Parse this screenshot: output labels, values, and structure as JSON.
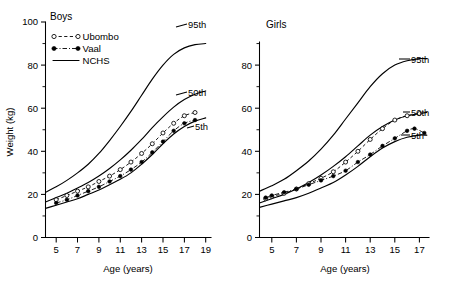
{
  "figure": {
    "axis_title_y": "Weight (kg)",
    "axis_title_x": "Age (years)"
  },
  "panels": [
    {
      "id": "boys",
      "title": "Boys",
      "y_label": "Weight (kg)",
      "x_label": "Age (years)",
      "y_ticks": [
        "0",
        "20",
        "40",
        "60",
        "80",
        "100"
      ],
      "x_ticks": [
        "5",
        "7",
        "9",
        "11",
        "13",
        "15",
        "17",
        "19"
      ],
      "curve_labels": [
        "95th",
        "50th",
        "5th"
      ]
    },
    {
      "id": "girls",
      "title": "Girls",
      "y_label": "",
      "x_label": "Age (years)",
      "y_ticks": [
        "0",
        "20",
        "40",
        "60",
        "80"
      ],
      "x_ticks": [
        "5",
        "7",
        "9",
        "11",
        "13",
        "15",
        "17"
      ],
      "curve_labels": [
        "95th",
        "50th",
        "5th"
      ]
    }
  ],
  "legend": {
    "items": [
      {
        "label": "Ubombo",
        "style": "dashed-open-circle"
      },
      {
        "label": "Vaal",
        "style": "dashdot-filled-circle"
      },
      {
        "label": "NCHS",
        "style": "solid-line"
      }
    ]
  },
  "chart_data": {
    "type": "line",
    "xlabel": "Age (years)",
    "ylabel": "Weight (kg)",
    "grid": false,
    "legend_position": "top-left",
    "panels": [
      {
        "panel": "Boys",
        "xlim": [
          4,
          19.5
        ],
        "ylim": [
          0,
          100
        ],
        "x_ticks": [
          5,
          7,
          9,
          11,
          13,
          15,
          17,
          19
        ],
        "y_ticks": [
          0,
          20,
          40,
          60,
          80,
          100
        ],
        "y_minor_ticks": [
          10,
          30,
          50,
          70,
          90
        ],
        "series": [
          {
            "name": "NCHS 95th",
            "style": "solid",
            "x": [
              4,
              5,
              6,
              7,
              8,
              9,
              10,
              11,
              12,
              13,
              14,
              15,
              16,
              17,
              18,
              19
            ],
            "y": [
              21.0,
              23.5,
              26.5,
              30.0,
              34.0,
              39.0,
              45.0,
              51.5,
              58.5,
              66.0,
              73.5,
              80.0,
              85.0,
              88.0,
              89.5,
              90.0
            ]
          },
          {
            "name": "NCHS 50th",
            "style": "solid",
            "x": [
              4,
              5,
              6,
              7,
              8,
              9,
              10,
              11,
              12,
              13,
              14,
              15,
              16,
              17,
              18,
              19
            ],
            "y": [
              16.5,
              18.5,
              20.5,
              23.0,
              25.5,
              28.5,
              32.0,
              36.0,
              40.5,
              45.5,
              51.0,
              56.0,
              60.5,
              64.0,
              66.5,
              68.0
            ]
          },
          {
            "name": "NCHS 5th",
            "style": "solid",
            "x": [
              4,
              5,
              6,
              7,
              8,
              9,
              10,
              11,
              12,
              13,
              14,
              15,
              16,
              17,
              18,
              19
            ],
            "y": [
              13.5,
              15.0,
              16.5,
              18.0,
              20.0,
              22.0,
              24.5,
              27.0,
              30.0,
              34.0,
              38.5,
              43.5,
              48.0,
              51.5,
              54.0,
              55.5
            ]
          },
          {
            "name": "Ubombo",
            "style": "dashed",
            "marker": "open-circle",
            "x": [
              5,
              6,
              7,
              8,
              9,
              10,
              11,
              12,
              13,
              14,
              15,
              16,
              17,
              18
            ],
            "y": [
              17.5,
              19.5,
              21.5,
              23.5,
              26.0,
              28.5,
              31.5,
              35.0,
              39.0,
              43.5,
              48.5,
              53.0,
              56.5,
              58.0
            ]
          },
          {
            "name": "Vaal",
            "style": "dash-dot",
            "marker": "filled-circle",
            "x": [
              5,
              6,
              7,
              8,
              9,
              10,
              11,
              12,
              13,
              14,
              15,
              16,
              17,
              18
            ],
            "y": [
              16.0,
              17.5,
              19.5,
              21.5,
              23.5,
              26.0,
              28.5,
              31.5,
              35.0,
              39.5,
              44.5,
              49.5,
              53.0,
              54.5
            ]
          }
        ],
        "annotations": [
          {
            "text": "95th",
            "x": 18.6,
            "y": 90
          },
          {
            "text": "50th",
            "x": 18.6,
            "y": 68
          },
          {
            "text": "5th",
            "x": 18.8,
            "y": 55
          }
        ]
      },
      {
        "panel": "Girls",
        "xlim": [
          4,
          17.8
        ],
        "ylim": [
          0,
          90
        ],
        "x_ticks": [
          5,
          7,
          9,
          11,
          13,
          15,
          17
        ],
        "y_ticks": [
          0,
          20,
          40,
          60,
          80
        ],
        "y_minor_ticks": [
          10,
          30,
          50,
          70
        ],
        "series": [
          {
            "name": "NCHS 95th",
            "style": "solid",
            "x": [
              4,
              5,
              6,
              7,
              8,
              9,
              10,
              11,
              12,
              13,
              14,
              15,
              16,
              17,
              17.6
            ],
            "y": [
              21.5,
              24.0,
              27.0,
              31.0,
              35.5,
              41.0,
              47.5,
              55.0,
              62.5,
              70.0,
              76.0,
              80.0,
              82.0,
              83.0,
              83.0
            ]
          },
          {
            "name": "NCHS 50th",
            "style": "solid",
            "x": [
              4,
              5,
              6,
              7,
              8,
              9,
              10,
              11,
              12,
              13,
              14,
              15,
              16,
              17,
              17.6
            ],
            "y": [
              16.0,
              18.0,
              20.0,
              22.5,
              25.5,
              29.0,
              33.0,
              37.5,
              42.5,
              47.5,
              51.5,
              54.5,
              56.5,
              57.5,
              58.0
            ]
          },
          {
            "name": "NCHS 5th",
            "style": "solid",
            "x": [
              4,
              5,
              6,
              7,
              8,
              9,
              10,
              11,
              12,
              13,
              14,
              15,
              16,
              17,
              17.6
            ],
            "y": [
              14.0,
              15.5,
              17.0,
              18.5,
              20.5,
              23.0,
              25.5,
              29.0,
              33.0,
              37.5,
              41.5,
              44.5,
              46.5,
              47.5,
              47.5
            ]
          },
          {
            "name": "Ubombo",
            "style": "dashed",
            "marker": "open-circle",
            "x": [
              4.5,
              5,
              6,
              7,
              8,
              9,
              10,
              11,
              12,
              13,
              14,
              15,
              16,
              17
            ],
            "y": [
              18.0,
              19.0,
              20.5,
              22.5,
              25.0,
              27.5,
              30.5,
              35.0,
              40.0,
              45.5,
              50.5,
              54.5,
              56.5,
              57.5
            ]
          },
          {
            "name": "Vaal",
            "style": "dash-dot",
            "marker": "filled-circle",
            "x": [
              4.5,
              5,
              6,
              7,
              8,
              9,
              10,
              11,
              12,
              13,
              14,
              15,
              16,
              16.6,
              17.4
            ],
            "y": [
              18.5,
              19.5,
              21.0,
              22.5,
              24.5,
              26.5,
              28.5,
              31.0,
              35.0,
              38.5,
              42.5,
              46.0,
              49.5,
              50.5,
              48.5
            ]
          }
        ],
        "annotations": [
          {
            "text": "95th",
            "x": 17.7,
            "y": 83
          },
          {
            "text": "50th",
            "x": 17.5,
            "y": 58
          },
          {
            "text": "5th",
            "x": 17.7,
            "y": 47.5
          }
        ]
      }
    ]
  }
}
